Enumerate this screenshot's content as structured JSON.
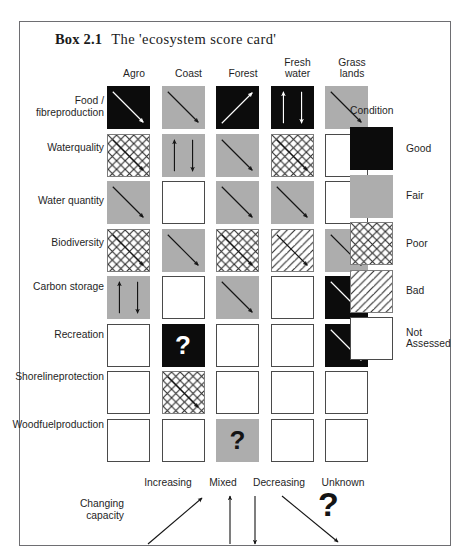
{
  "box": {
    "label": "Box 2.1",
    "caption": "The 'ecosystem score card'"
  },
  "columns": [
    {
      "id": "agro",
      "lines": [
        "Agro"
      ]
    },
    {
      "id": "coast",
      "lines": [
        "Coast"
      ]
    },
    {
      "id": "forest",
      "lines": [
        "Forest"
      ]
    },
    {
      "id": "freshwater",
      "lines": [
        "Fresh",
        "water"
      ]
    },
    {
      "id": "grasslands",
      "lines": [
        "Grass",
        "lands"
      ]
    }
  ],
  "rows": [
    {
      "id": "food-fibre-production",
      "lines": [
        "Food / fibre",
        "production"
      ]
    },
    {
      "id": "water-quality",
      "lines": [
        "Water",
        "quality"
      ]
    },
    {
      "id": "water-quantity",
      "lines": [
        "Water quantity"
      ]
    },
    {
      "id": "biodiversity",
      "lines": [
        "Biodiversity"
      ]
    },
    {
      "id": "carbon-storage",
      "lines": [
        "Carbon storage"
      ]
    },
    {
      "id": "recreation",
      "lines": [
        "Recreation"
      ]
    },
    {
      "id": "shoreline-protection",
      "lines": [
        "Shoreline",
        "protection"
      ]
    },
    {
      "id": "woodfuel-production",
      "lines": [
        "Woodfuel",
        "production"
      ]
    }
  ],
  "chart_data": {
    "type": "table",
    "title": "The 'ecosystem score card'",
    "categories": [
      "Agro",
      "Coast",
      "Forest",
      "Fresh water",
      "Grass lands"
    ],
    "row_categories": [
      "Food / fibre production",
      "Water quality",
      "Water quantity",
      "Biodiversity",
      "Carbon storage",
      "Recreation",
      "Shoreline protection",
      "Woodfuel production"
    ],
    "value_scale": [
      "good",
      "fair",
      "poor",
      "bad",
      "none"
    ],
    "trend_scale": [
      "increasing",
      "mixed",
      "decreasing",
      "unknown",
      "none"
    ],
    "cells": [
      [
        {
          "condition": "good",
          "trend": "decreasing"
        },
        {
          "condition": "fair",
          "trend": "decreasing"
        },
        {
          "condition": "good",
          "trend": "increasing"
        },
        {
          "condition": "good",
          "trend": "mixed"
        },
        {
          "condition": "fair",
          "trend": "decreasing"
        }
      ],
      [
        {
          "condition": "poor",
          "trend": "decreasing"
        },
        {
          "condition": "fair",
          "trend": "mixed"
        },
        {
          "condition": "fair",
          "trend": "decreasing"
        },
        {
          "condition": "poor",
          "trend": "decreasing"
        },
        {
          "condition": "none",
          "trend": "none"
        }
      ],
      [
        {
          "condition": "fair",
          "trend": "decreasing"
        },
        {
          "condition": "none",
          "trend": "none"
        },
        {
          "condition": "fair",
          "trend": "decreasing"
        },
        {
          "condition": "fair",
          "trend": "decreasing"
        },
        {
          "condition": "none",
          "trend": "none"
        }
      ],
      [
        {
          "condition": "poor",
          "trend": "decreasing"
        },
        {
          "condition": "fair",
          "trend": "decreasing"
        },
        {
          "condition": "poor",
          "trend": "decreasing"
        },
        {
          "condition": "bad",
          "trend": "decreasing"
        },
        {
          "condition": "fair",
          "trend": "decreasing"
        }
      ],
      [
        {
          "condition": "fair",
          "trend": "mixed"
        },
        {
          "condition": "none",
          "trend": "none"
        },
        {
          "condition": "fair",
          "trend": "decreasing"
        },
        {
          "condition": "none",
          "trend": "none"
        },
        {
          "condition": "good",
          "trend": "decreasing"
        }
      ],
      [
        {
          "condition": "none",
          "trend": "none"
        },
        {
          "condition": "good",
          "trend": "unknown"
        },
        {
          "condition": "none",
          "trend": "none"
        },
        {
          "condition": "none",
          "trend": "none"
        },
        {
          "condition": "good",
          "trend": "decreasing"
        }
      ],
      [
        {
          "condition": "none",
          "trend": "none"
        },
        {
          "condition": "poor",
          "trend": "decreasing"
        },
        {
          "condition": "none",
          "trend": "none"
        },
        {
          "condition": "none",
          "trend": "none"
        },
        {
          "condition": "none",
          "trend": "none"
        }
      ],
      [
        {
          "condition": "none",
          "trend": "none"
        },
        {
          "condition": "none",
          "trend": "none"
        },
        {
          "condition": "fair",
          "trend": "unknown"
        },
        {
          "condition": "none",
          "trend": "none"
        },
        {
          "condition": "none",
          "trend": "none"
        }
      ]
    ]
  },
  "legend_condition": {
    "title": "Condition",
    "items": [
      {
        "id": "good",
        "condition": "good",
        "lines": [
          "Good"
        ]
      },
      {
        "id": "fair",
        "condition": "fair",
        "lines": [
          "Fair"
        ]
      },
      {
        "id": "poor",
        "condition": "poor",
        "lines": [
          "Poor"
        ]
      },
      {
        "id": "bad",
        "condition": "bad",
        "lines": [
          "Bad"
        ]
      },
      {
        "id": "not-assessed",
        "condition": "none",
        "lines": [
          "Not",
          "Assessed"
        ]
      }
    ]
  },
  "legend_change": {
    "label_lines": [
      "Changing",
      "capacity"
    ],
    "items": [
      {
        "id": "increasing",
        "label": "Increasing"
      },
      {
        "id": "mixed",
        "label": "Mixed"
      },
      {
        "id": "decreasing",
        "label": "Decreasing"
      },
      {
        "id": "unknown",
        "label": "Unknown"
      }
    ],
    "unknown_glyph": "?"
  },
  "colors": {
    "good": "#0c0c0c",
    "fair": "#adadad",
    "none": "#ffffff",
    "frame": "#6e6e72",
    "text": "#1f1f1f"
  }
}
